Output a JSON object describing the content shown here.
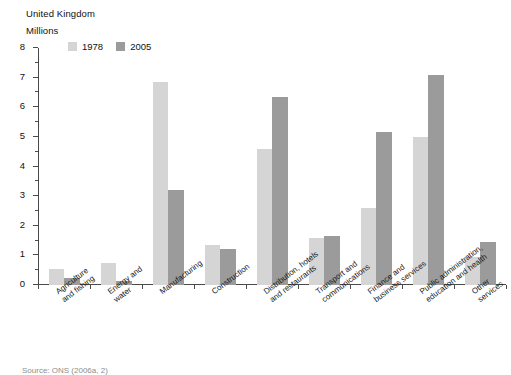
{
  "region_title": "United Kingdom",
  "axis_units": "Millions",
  "source_note": "Source: ONS (2006a, 2)",
  "legend": {
    "items": [
      {
        "label": "1978",
        "color": "#d5d5d5"
      },
      {
        "label": "2005",
        "color": "#9b9b9b"
      }
    ]
  },
  "chart_data": {
    "type": "bar",
    "title": "United Kingdom",
    "subtitle": "Millions",
    "xlabel": "",
    "ylabel": "Millions",
    "ylim": [
      0,
      8
    ],
    "yticks": [
      0,
      1,
      2,
      3,
      4,
      5,
      6,
      7,
      8
    ],
    "ytick_labels": [
      "0",
      "1",
      "2",
      "3",
      "4",
      "5",
      "6",
      "7",
      "8"
    ],
    "minor_ticks": true,
    "grid": false,
    "legend_position": "top-left",
    "categories": [
      "Agriculture and fishing",
      "Energy and water",
      "Manufacturing",
      "Construction",
      "Distribution, hotels and restaurants",
      "Transport and communications",
      "Finance and business services",
      "Public administration, education and health",
      "Other services"
    ],
    "category_lines": [
      [
        "Agriculture",
        "and fishing"
      ],
      [
        "Energy and",
        "water"
      ],
      [
        "Manufacturing"
      ],
      [
        "Construction"
      ],
      [
        "Distribution, hotels",
        "and restaurants"
      ],
      [
        "Transport and",
        "communications"
      ],
      [
        "Finance and",
        "business services"
      ],
      [
        "Public administration,",
        "education and health"
      ],
      [
        "Other services"
      ]
    ],
    "series": [
      {
        "name": "1978",
        "color": "#d5d5d5",
        "values": [
          0.55,
          0.75,
          6.85,
          1.35,
          4.6,
          1.6,
          2.6,
          5.0,
          0.95
        ]
      },
      {
        "name": "2005",
        "color": "#9b9b9b",
        "values": [
          0.25,
          0.15,
          3.2,
          1.2,
          6.35,
          1.65,
          5.15,
          7.1,
          1.45
        ]
      }
    ]
  }
}
